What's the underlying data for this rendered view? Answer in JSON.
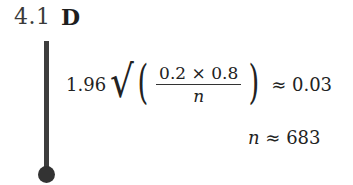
{
  "question": {
    "number": "4.1",
    "answer": "D"
  },
  "solution": {
    "line1": {
      "coefficient": "1.96",
      "sqrt_symbol": "√",
      "left_paren": "(",
      "numerator": "0.2 × 0.8",
      "denominator": "n",
      "right_paren": ")",
      "relation": "≈ 0.03"
    },
    "line2": {
      "variable": "n",
      "relation": "≈ 683"
    }
  },
  "colors": {
    "bar": "#3d3d3d",
    "dot": "#333333",
    "text": "#222222"
  }
}
